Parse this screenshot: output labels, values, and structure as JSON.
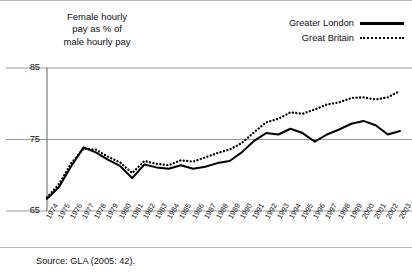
{
  "chart_data": {
    "type": "line",
    "title": "Female hourly\npay as % of\nmale hourly pay",
    "xlabel": "",
    "ylabel": "Female hourly pay as % of male hourly pay",
    "ylim": [
      65,
      85
    ],
    "yticks": [
      65,
      75,
      85
    ],
    "grid": true,
    "legend_position": "top-right",
    "categories": [
      "1974",
      "1975",
      "1976",
      "1977",
      "1978",
      "1979",
      "1980",
      "1981",
      "1982",
      "1983",
      "1984",
      "1985",
      "1986",
      "1987",
      "1988",
      "1989",
      "1990",
      "1991",
      "1992",
      "1993",
      "1994",
      "1995",
      "1996",
      "1997",
      "1998",
      "1999",
      "2000",
      "2001",
      "2002",
      "2003"
    ],
    "series": [
      {
        "name": "Greater London",
        "style": "solid",
        "color": "#000000",
        "values": [
          66.7,
          68.4,
          71.3,
          73.9,
          73.2,
          72.2,
          71.3,
          69.6,
          71.5,
          71.1,
          70.9,
          71.4,
          70.9,
          71.2,
          71.7,
          72.0,
          73.2,
          74.8,
          75.9,
          75.7,
          76.5,
          75.9,
          74.7,
          75.7,
          76.4,
          77.2,
          77.6,
          77.0,
          75.7,
          76.2
        ]
      },
      {
        "name": "Great Britain",
        "style": "dotted",
        "color": "#000000",
        "values": [
          66.9,
          68.8,
          71.7,
          73.7,
          73.6,
          72.6,
          71.8,
          70.3,
          72.0,
          71.6,
          71.4,
          72.1,
          71.9,
          72.5,
          73.1,
          73.6,
          74.5,
          76.0,
          77.4,
          77.9,
          78.8,
          78.6,
          79.2,
          79.9,
          80.2,
          80.8,
          80.9,
          80.6,
          80.9,
          81.8
        ]
      }
    ]
  },
  "legend": {
    "items": [
      {
        "label": "Greater London",
        "style": "solid"
      },
      {
        "label": "Great Britain",
        "style": "dotted"
      }
    ]
  },
  "source": {
    "text": "Source: GLA (2005: 42)."
  }
}
